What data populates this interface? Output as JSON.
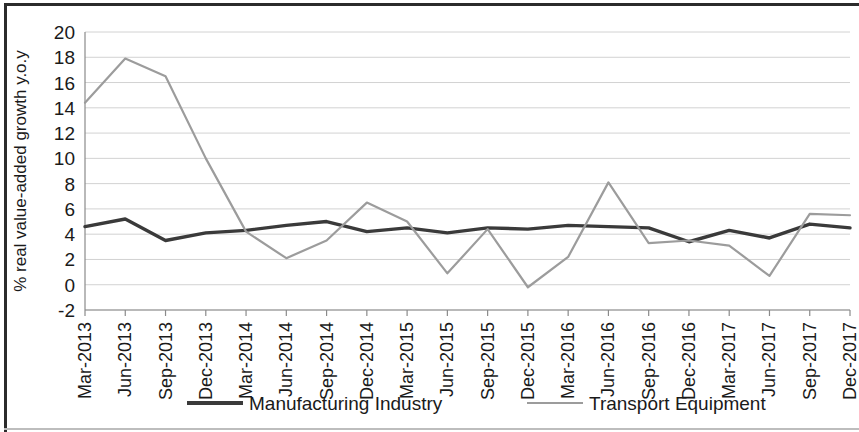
{
  "figure": {
    "border_color": "#2b2b2b",
    "background": "#ffffff"
  },
  "chart_data": {
    "type": "line",
    "title": "",
    "xlabel": "",
    "ylabel": "% real value-added growth y.o.y",
    "ylim": [
      -2,
      20
    ],
    "yticks": [
      -2,
      0,
      2,
      4,
      6,
      8,
      10,
      12,
      14,
      16,
      18,
      20
    ],
    "ytick_labels": [
      "-2",
      "0",
      "2",
      "4",
      "6",
      "8",
      "10",
      "12",
      "14",
      "16",
      "18",
      "20"
    ],
    "grid": true,
    "grid_axis": "y",
    "legend_position": "bottom",
    "categories": [
      "Mar-2013",
      "Jun-2013",
      "Sep-2013",
      "Dec-2013",
      "Mar-2014",
      "Jun-2014",
      "Sep-2014",
      "Dec-2014",
      "Mar-2015",
      "Jun-2015",
      "Sep-2015",
      "Dec-2015",
      "Mar-2016",
      "Jun-2016",
      "Sep-2016",
      "Dec-2016",
      "Mar-2017",
      "Jun-2017",
      "Sep-2017",
      "Dec-2017"
    ],
    "series": [
      {
        "name": "Manufacturing Industry",
        "color": "#3a3a3a",
        "width": 3.4,
        "values": [
          4.6,
          5.2,
          3.5,
          4.1,
          4.3,
          4.7,
          5.0,
          4.2,
          4.5,
          4.1,
          4.5,
          4.4,
          4.7,
          4.6,
          4.5,
          3.4,
          4.3,
          3.7,
          4.8,
          4.5
        ]
      },
      {
        "name": "Transport Equipment",
        "color": "#9c9c9c",
        "width": 2.2,
        "values": [
          14.4,
          17.9,
          16.5,
          10.0,
          4.2,
          2.1,
          3.5,
          6.5,
          5.0,
          0.9,
          4.4,
          -0.2,
          2.2,
          8.1,
          3.3,
          3.5,
          3.1,
          0.7,
          5.6,
          5.5
        ]
      }
    ]
  },
  "legend": {
    "items": [
      {
        "label": "Manufacturing Industry",
        "color": "#3a3a3a",
        "line_width": 4
      },
      {
        "label": "Transport Equipment",
        "color": "#9c9c9c",
        "line_width": 2
      }
    ]
  }
}
